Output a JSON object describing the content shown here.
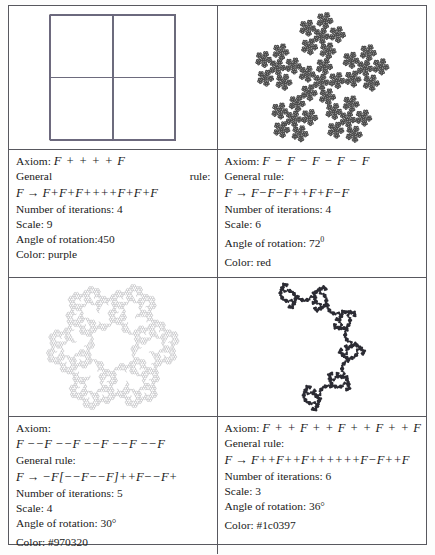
{
  "document": {
    "type": "fractal-parameter-table",
    "columns": 2,
    "rows": 4
  },
  "panels": [
    {
      "id": "panel-1",
      "axiom_label": "Axiom:",
      "axiom": "F + + + + F",
      "rule_label_left": "General",
      "rule_label_right": "rule:",
      "rule_lhs": "F",
      "rule_arrow": "→",
      "rule_rhs": "F+F+F++++F+F+F",
      "iterations_label": "Number of iterations: 4",
      "scale_label": "Scale: 9",
      "angle_label": "Angle of rotation:450",
      "color_label": "Color: purple",
      "color_value": "purple",
      "stroke": "#6d6a7e",
      "fractal": "cross-4fold-outline"
    },
    {
      "id": "panel-2",
      "axiom_label": "Axiom:",
      "axiom": "F − F − F − F − F",
      "rule_label": "General rule:",
      "rule_lhs": "F",
      "rule_arrow": "→",
      "rule_rhs": "F−F−F++F+F−F",
      "iterations_label": "Number of iterations: 4",
      "scale_label": "Scale: 6",
      "angle_label": "Angle of rotation: 72",
      "angle_sup": "0",
      "color_label": "Color: red",
      "color_value": "red",
      "stroke": "#4c4c4c",
      "fractal": "pentaflake-5fold-filled"
    },
    {
      "id": "panel-3",
      "axiom_label": "Axiom:",
      "axiom": "F −−F −−F −−F −−F −−F",
      "rule_label": "General rule:",
      "rule_lhs": "F",
      "rule_arrow": "→",
      "rule_rhs": "−F[−−F−−F]++F−−F+",
      "iterations_label": "Number of iterations: 5",
      "scale_label": "Scale: 4",
      "angle_label": "Angle of rotation: 30°",
      "color_label": "Color: #970320",
      "color_value": "#970320",
      "stroke": "#b9b9bd",
      "fractal": "hex-ring-lace"
    },
    {
      "id": "panel-4",
      "axiom_label": "Axiom:",
      "axiom": "F + + F + + F + + F + + F",
      "rule_label": "General rule:",
      "rule_lhs": "F",
      "rule_arrow": "→",
      "rule_rhs": "F++F++F++++++F−F++F",
      "iterations_label": "Number of iterations: 6",
      "scale_label": "Scale: 3",
      "angle_label": "Angle of rotation: 36°",
      "color_label": "Color: #1c0397",
      "color_value": "#1c0397",
      "stroke": "#2b2b33",
      "fractal": "pentagonal-dense-dark"
    }
  ]
}
